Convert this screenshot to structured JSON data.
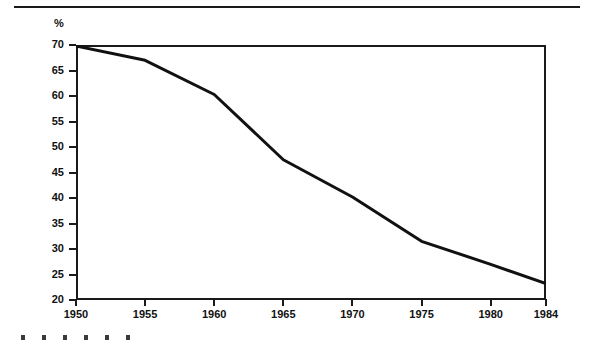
{
  "chart_data": {
    "type": "line",
    "title": "",
    "subtitle": "",
    "xlabel": "",
    "ylabel": "%",
    "x": [
      1950,
      1955,
      1960,
      1965,
      1970,
      1975,
      1980,
      1984
    ],
    "values": [
      69.8,
      67.0,
      60.3,
      47.5,
      40.2,
      31.5,
      27.0,
      23.2
    ],
    "series": [
      {
        "name": "",
        "values": [
          69.8,
          67.0,
          60.3,
          47.5,
          40.2,
          31.5,
          27.0,
          23.2
        ]
      }
    ],
    "xlim": [
      1950,
      1984
    ],
    "ylim": [
      20,
      70
    ],
    "y_ticks": [
      70,
      65,
      60,
      55,
      50,
      45,
      40,
      35,
      30,
      25,
      20
    ],
    "y_tick_labels": [
      "70",
      "65",
      "60",
      "55",
      "50",
      "45",
      "40",
      "35",
      "30",
      "25",
      "20"
    ],
    "x_ticks": [
      1950,
      1955,
      1960,
      1965,
      1970,
      1975,
      1980,
      1984
    ],
    "x_tick_labels": [
      "1950",
      "1955",
      "1960",
      "1965",
      "1970",
      "1975",
      "1980",
      "1984"
    ],
    "grid": false,
    "legend": false,
    "legend_position": "none",
    "line_color": "#111111",
    "frame_color": "#1a1a1a",
    "background_color": "#ffffff",
    "annotations": []
  },
  "figure": {
    "y_axis_unit": "%",
    "scan_marks_count": 6
  }
}
